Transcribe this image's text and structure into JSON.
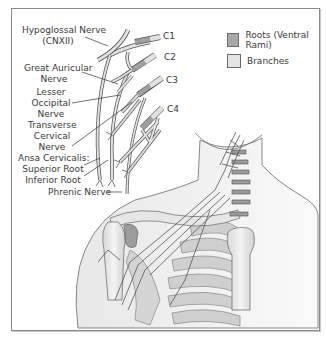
{
  "diagram": {
    "labels": {
      "hypoglossal": [
        "Hypoglossal Nerve",
        "(CNXII)"
      ],
      "great_auricular": [
        "Great Auricular",
        "Nerve"
      ],
      "lesser_occipital": [
        "Lesser",
        "Occipital",
        "Nerve"
      ],
      "transverse_cervical": [
        "Transverse",
        "Cervical",
        "Nerve"
      ],
      "ansa_cervicalis": [
        "Ansa Cervicalis:",
        "Superior Root",
        "Inferior Root"
      ],
      "phrenic": "Phrenic Nerve"
    },
    "roots": [
      "C1",
      "C2",
      "C3",
      "C4"
    ]
  },
  "legend": {
    "items": [
      {
        "label": "Roots (Ventral Rami)",
        "color": "#a8a8a8"
      },
      {
        "label": "Branches",
        "color": "#e4e4e4"
      }
    ]
  },
  "colors": {
    "frame": "#8a8a8a",
    "root": "#a0a0a0",
    "branch": "#e2e2e2",
    "outline": "#555555",
    "skin": "#ececec"
  }
}
